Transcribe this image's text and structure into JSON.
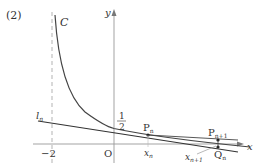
{
  "problem_label": "(2)",
  "curve_label": "C",
  "axes": {
    "x_label": "x",
    "y_label": "y",
    "origin_label": "O"
  },
  "asymptote": {
    "x_value": -2,
    "label": "−2"
  },
  "y_intercept": {
    "numerator": "1",
    "denominator": "2"
  },
  "tangent_line_label": {
    "main": "l",
    "sub": "n"
  },
  "points": {
    "Pn": {
      "main": "P",
      "sub": "n"
    },
    "Pn1": {
      "main": "P",
      "sub": "n+1"
    },
    "Qn": {
      "main": "Q",
      "sub": "n"
    }
  },
  "x_ticks": {
    "xn": {
      "main": "x",
      "sub": "n"
    },
    "xn1": {
      "main": "x",
      "sub": "n+1"
    }
  },
  "colors": {
    "curve": "#444444",
    "axis": "#999999",
    "line": "#333333",
    "text": "#333333"
  }
}
